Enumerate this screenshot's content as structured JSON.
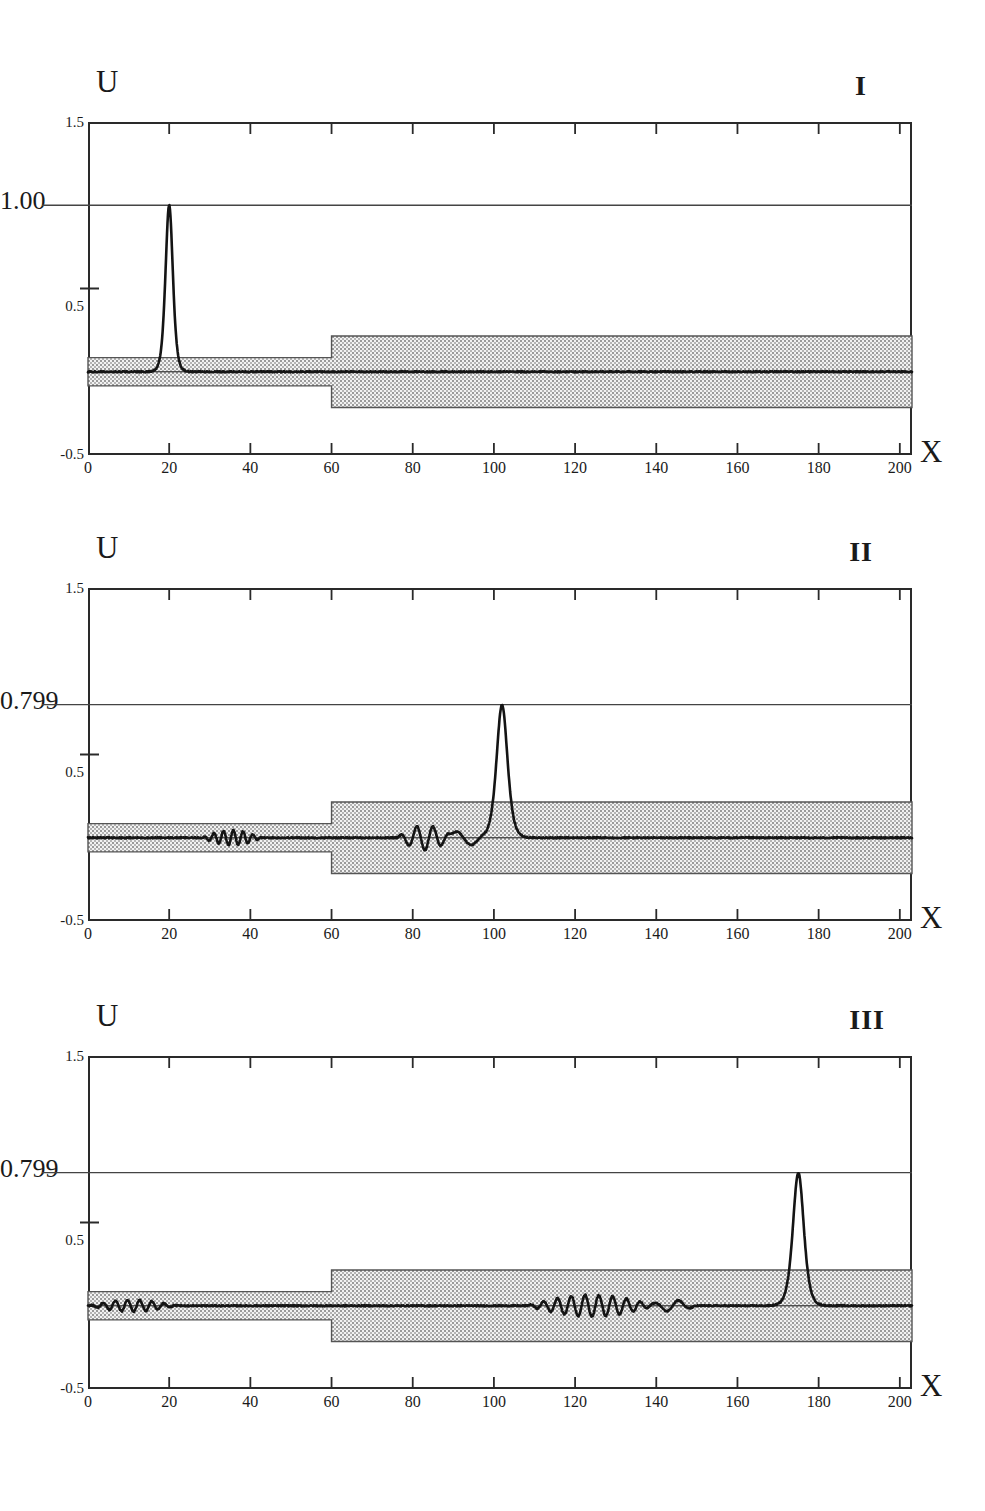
{
  "figure": {
    "panel_count": 3,
    "background_color": "#ffffff",
    "curve_color": "#141414",
    "band_color": "#c9c9c9",
    "frame_color": "#2a2a2a"
  },
  "axes": {
    "ylabel": "U",
    "xlabel": "X",
    "ylim": [
      -0.5,
      1.5
    ],
    "xlim": [
      0,
      203
    ],
    "ytick_labels": [
      "1.5",
      "0.5",
      "-0.5"
    ],
    "ytick_values": [
      1.5,
      0.5,
      -0.5
    ],
    "xtick_labels": [
      "0",
      "20",
      "40",
      "60",
      "80",
      "100",
      "120",
      "140",
      "160",
      "180",
      "200"
    ],
    "xtick_values": [
      0,
      20,
      40,
      60,
      80,
      100,
      120,
      140,
      160,
      180,
      200
    ]
  },
  "panels": [
    {
      "id": "I",
      "roman": "I",
      "ylabel": "U",
      "xlabel": "X",
      "peak_label": "1.00",
      "peak_value": 1.0,
      "peak_x": 20,
      "peak_width": 2.4
    },
    {
      "id": "II",
      "roman": "II",
      "ylabel": "U",
      "xlabel": "X",
      "peak_label": "0.799",
      "peak_value": 0.799,
      "peak_x": 102,
      "peak_width": 3.4
    },
    {
      "id": "III",
      "roman": "III",
      "ylabel": "U",
      "xlabel": "X",
      "peak_label": "0.799",
      "peak_value": 0.799,
      "peak_x": 175,
      "peak_width": 3.4
    }
  ],
  "chart_data": {
    "type": "line",
    "title": "",
    "xlabel": "X",
    "ylabel": "U",
    "xlim": [
      0,
      203
    ],
    "ylim": [
      -0.5,
      1.5
    ],
    "grid": false,
    "legend": null,
    "xticks": [
      0,
      20,
      40,
      60,
      80,
      100,
      120,
      140,
      160,
      180,
      200
    ],
    "yticks": [
      -0.5,
      0.5,
      1.5
    ],
    "annotations": [
      {
        "panel": "I",
        "text": "1.00",
        "y": 1.0,
        "type": "peak-level-line"
      },
      {
        "panel": "I",
        "text": "I",
        "position": "top-right"
      },
      {
        "panel": "II",
        "text": "0.799",
        "y": 0.799,
        "type": "peak-level-line"
      },
      {
        "panel": "II",
        "text": "II",
        "position": "top-right"
      },
      {
        "panel": "III",
        "text": "0.799",
        "y": 0.799,
        "type": "peak-level-line"
      },
      {
        "panel": "III",
        "text": "III",
        "position": "top-right"
      }
    ],
    "shaded_band": {
      "description": "stippled grey band around U = 0; half-height 0.085 for X<60, half-height 0.215 for X>60",
      "step_x": 60,
      "half_height_left": 0.085,
      "half_height_right": 0.215
    },
    "series": [
      {
        "name": "I",
        "panel": "I",
        "soliton": {
          "amplitude": 1.0,
          "center": 20.0,
          "width": 1.15
        },
        "background_level": 0.0,
        "oscillations": []
      },
      {
        "name": "II",
        "panel": "II",
        "soliton": {
          "amplitude": 0.799,
          "center": 102.0,
          "width": 1.7
        },
        "background_level": 0.0,
        "oscillations": [
          {
            "x_start": 28,
            "x_end": 43,
            "amplitude": 0.045,
            "wavelength": 2.4
          },
          {
            "x_start": 76,
            "x_end": 90,
            "amplitude": 0.075,
            "wavelength": 4.0
          },
          {
            "x_start": 88,
            "x_end": 98,
            "amplitude": 0.05,
            "wavelength": 9.0,
            "note": "broad trough"
          }
        ]
      },
      {
        "name": "III",
        "panel": "III",
        "soliton": {
          "amplitude": 0.799,
          "center": 175.0,
          "width": 1.7
        },
        "background_level": 0.0,
        "oscillations": [
          {
            "x_start": 0,
            "x_end": 22,
            "amplitude": 0.035,
            "wavelength": 3.0
          },
          {
            "x_start": 108,
            "x_end": 140,
            "amplitude": 0.065,
            "wavelength": 3.4
          },
          {
            "x_start": 138,
            "x_end": 150,
            "amplitude": 0.035,
            "wavelength": 6.0
          }
        ]
      }
    ]
  }
}
